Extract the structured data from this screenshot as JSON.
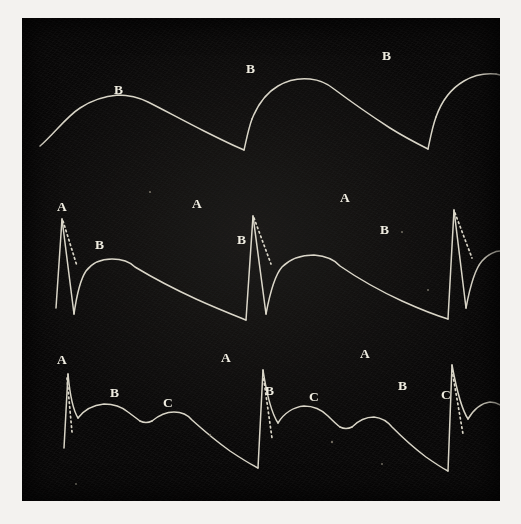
{
  "figure": {
    "background_color": "#f3f2ef",
    "plate_color": "#080707",
    "trace_color": "#d8d4c6"
  },
  "chart_data": {
    "type": "line",
    "subtitle": "Three superimposed pulse-wave tracings, three cycles each",
    "xlabel": "",
    "ylabel": "",
    "grid": false,
    "legend": "none",
    "axis_visible": false,
    "xlim": [
      0,
      478
    ],
    "ylim": [
      483,
      0
    ],
    "series": [
      {
        "name": "top-trace",
        "label_letters": [
          "B",
          "B",
          "B"
        ],
        "cycles": 3,
        "description": "Smooth rounded single-summit waves; gradual rise, rounded apex labelled B, long slow decline to a sharp notch, then steep rise to next cycle.",
        "points": [
          [
            18,
            128
          ],
          [
            30,
            117
          ],
          [
            42,
            104
          ],
          [
            54,
            94
          ],
          [
            66,
            87
          ],
          [
            80,
            83
          ],
          [
            96,
            81
          ],
          [
            112,
            82
          ],
          [
            128,
            85
          ],
          [
            146,
            90
          ],
          [
            164,
            96
          ],
          [
            182,
            103
          ],
          [
            198,
            110
          ],
          [
            214,
            117
          ],
          [
            226,
            122
          ],
          [
            234,
            124
          ],
          [
            240,
            112
          ],
          [
            248,
            96
          ],
          [
            256,
            84
          ],
          [
            266,
            76
          ],
          [
            278,
            71
          ],
          [
            292,
            69
          ],
          [
            306,
            70
          ],
          [
            322,
            74
          ],
          [
            340,
            80
          ],
          [
            358,
            87
          ],
          [
            376,
            94
          ],
          [
            394,
            101
          ],
          [
            410,
            108
          ],
          [
            424,
            114
          ],
          [
            432,
            117
          ],
          [
            438,
            104
          ],
          [
            446,
            88
          ],
          [
            454,
            76
          ],
          [
            464,
            68
          ],
          [
            476,
            63
          ],
          [
            490,
            62
          ],
          [
            504,
            64
          ],
          [
            520,
            69
          ],
          [
            538,
            76
          ],
          [
            556,
            84
          ],
          [
            574,
            92
          ],
          [
            592,
            100
          ],
          [
            608,
            107
          ],
          [
            620,
            112
          ]
        ]
      },
      {
        "name": "middle-trace",
        "label_letters": [
          "A",
          "B",
          "A",
          "B",
          "A",
          "B"
        ],
        "cycles": 3,
        "description": "Sharp tall spike A with near-vertical upstroke and rapid fall to a deep trough; a dotted chord runs from the A summit down to the foot of the B wave. B is a low rounded secondary summit followed by a long gentle decline.",
        "points": [
          [
            16,
            297
          ],
          [
            28,
            290
          ],
          [
            40,
            282
          ],
          [
            48,
            200
          ],
          [
            54,
            236
          ],
          [
            60,
            262
          ],
          [
            64,
            280
          ],
          [
            66,
            292
          ],
          [
            72,
            276
          ],
          [
            80,
            258
          ],
          [
            90,
            248
          ],
          [
            102,
            244
          ],
          [
            116,
            243
          ],
          [
            134,
            246
          ],
          [
            154,
            252
          ],
          [
            176,
            259
          ],
          [
            198,
            266
          ],
          [
            220,
            273
          ],
          [
            240,
            280
          ],
          [
            254,
            285
          ],
          [
            262,
            198
          ],
          [
            268,
            228
          ],
          [
            274,
            250
          ],
          [
            280,
            266
          ],
          [
            284,
            278
          ],
          [
            292,
            262
          ],
          [
            302,
            248
          ],
          [
            314,
            241
          ],
          [
            328,
            238
          ],
          [
            344,
            239
          ],
          [
            362,
            243
          ],
          [
            382,
            250
          ],
          [
            402,
            258
          ],
          [
            422,
            266
          ],
          [
            442,
            274
          ],
          [
            460,
            281
          ],
          [
            472,
            285
          ],
          [
            478,
            196
          ],
          [
            484,
            224
          ],
          [
            490,
            246
          ],
          [
            496,
            262
          ],
          [
            500,
            274
          ]
        ]
      },
      {
        "name": "bottom-trace",
        "label_letters": [
          "A",
          "B",
          "C",
          "A",
          "B",
          "C",
          "A",
          "B",
          "C"
        ],
        "cycles": 3,
        "description": "Tall narrow spike A, then a rounded B summit, a shallow notch, then a lower rounded C summit, then a long descent to the baseline trough before the next spike.",
        "points": [
          [
            42,
            356
          ],
          [
            48,
            380
          ],
          [
            54,
            396
          ],
          [
            58,
            408
          ],
          [
            64,
            398
          ],
          [
            72,
            390
          ],
          [
            82,
            386
          ],
          [
            94,
            385
          ],
          [
            106,
            387
          ],
          [
            116,
            392
          ],
          [
            124,
            398
          ],
          [
            130,
            401
          ],
          [
            136,
            396
          ],
          [
            146,
            391
          ],
          [
            158,
            390
          ],
          [
            170,
            393
          ],
          [
            184,
            399
          ],
          [
            200,
            407
          ],
          [
            216,
            415
          ],
          [
            232,
            422
          ],
          [
            248,
            428
          ],
          [
            258,
            431
          ],
          [
            264,
            348
          ],
          [
            270,
            372
          ],
          [
            276,
            390
          ],
          [
            280,
            402
          ],
          [
            286,
            393
          ],
          [
            294,
            385
          ],
          [
            304,
            381
          ],
          [
            316,
            380
          ],
          [
            328,
            383
          ],
          [
            338,
            389
          ],
          [
            346,
            395
          ],
          [
            352,
            398
          ],
          [
            358,
            393
          ],
          [
            368,
            388
          ],
          [
            380,
            387
          ],
          [
            392,
            390
          ],
          [
            406,
            397
          ],
          [
            422,
            405
          ],
          [
            438,
            413
          ],
          [
            454,
            420
          ],
          [
            468,
            426
          ]
        ]
      }
    ]
  },
  "traces": [
    {
      "id": "top",
      "name": "top-pulse-trace",
      "labels": [
        {
          "text": "B",
          "x": 92,
          "y": 76
        },
        {
          "text": "B",
          "x": 224,
          "y": 55
        },
        {
          "text": "B",
          "x": 360,
          "y": 42
        }
      ]
    },
    {
      "id": "middle",
      "name": "middle-pulse-trace",
      "labels": [
        {
          "text": "A",
          "x": 35,
          "y": 193
        },
        {
          "text": "B",
          "x": 73,
          "y": 231
        },
        {
          "text": "A",
          "x": 170,
          "y": 190
        },
        {
          "text": "B",
          "x": 215,
          "y": 226
        },
        {
          "text": "A",
          "x": 318,
          "y": 184
        },
        {
          "text": "B",
          "x": 358,
          "y": 216
        }
      ]
    },
    {
      "id": "bottom",
      "name": "bottom-pulse-trace",
      "labels": [
        {
          "text": "A",
          "x": 35,
          "y": 346
        },
        {
          "text": "B",
          "x": 88,
          "y": 379
        },
        {
          "text": "C",
          "x": 141,
          "y": 389
        },
        {
          "text": "A",
          "x": 199,
          "y": 344
        },
        {
          "text": "B",
          "x": 243,
          "y": 377
        },
        {
          "text": "C",
          "x": 287,
          "y": 383
        },
        {
          "text": "A",
          "x": 338,
          "y": 340
        },
        {
          "text": "B",
          "x": 376,
          "y": 372
        },
        {
          "text": "C",
          "x": 419,
          "y": 381
        }
      ]
    }
  ]
}
